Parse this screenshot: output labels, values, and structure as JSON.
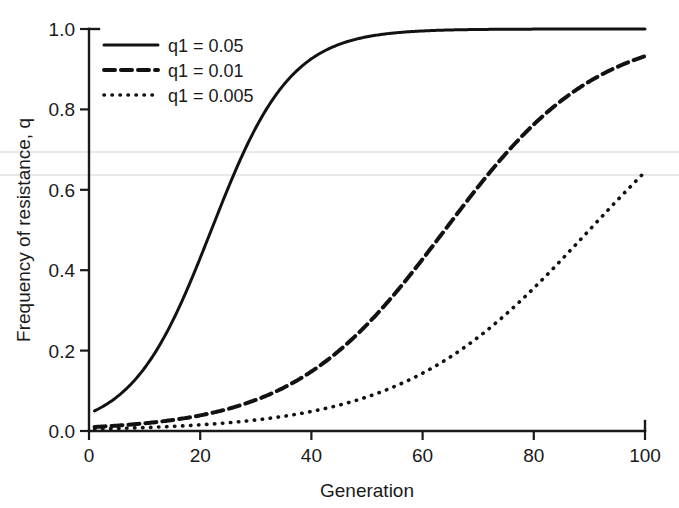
{
  "chart_data": {
    "type": "line",
    "title": "",
    "xlabel": "Generation",
    "ylabel": "Frequency of resistance, q",
    "xlim": [
      0,
      100
    ],
    "ylim": [
      0.0,
      1.0
    ],
    "xticks": [
      0,
      20,
      40,
      60,
      80,
      100
    ],
    "yticks": [
      0.0,
      0.2,
      0.4,
      0.6,
      0.8,
      1.0
    ],
    "xtick_labels": [
      "0",
      "20",
      "40",
      "60",
      "80",
      "100"
    ],
    "ytick_labels": [
      "0.0",
      "0.2",
      "0.4",
      "0.6",
      "0.8",
      "1.0"
    ],
    "grid": false,
    "legend_position": "top-left",
    "series": [
      {
        "name": "q1 = 0.05",
        "style": "solid",
        "color": "#121212",
        "q1": 0.05,
        "growth_rate": 0.3,
        "midpoint_generation": 22,
        "x": [
          1,
          5,
          10,
          14,
          18,
          20,
          22,
          24,
          26,
          28,
          30,
          35,
          40,
          50,
          60,
          70,
          80,
          90,
          100
        ],
        "y": [
          0.05,
          0.083,
          0.155,
          0.243,
          0.372,
          0.443,
          0.517,
          0.59,
          0.659,
          0.722,
          0.777,
          0.877,
          0.935,
          0.985,
          0.997,
          0.999,
          1.0,
          1.0,
          1.0
        ]
      },
      {
        "name": "q1 = 0.01",
        "style": "dashed",
        "color": "#121212",
        "q1": 0.01,
        "growth_rate": 0.3,
        "midpoint_generation": 64,
        "x": [
          1,
          10,
          20,
          30,
          40,
          45,
          50,
          55,
          58,
          60,
          62,
          64,
          66,
          68,
          70,
          75,
          80,
          90,
          100
        ],
        "y": [
          0.01,
          0.015,
          0.025,
          0.042,
          0.069,
          0.088,
          0.112,
          0.141,
          0.161,
          0.175,
          0.19,
          0.5,
          0.7,
          0.85,
          0.94,
          0.988,
          0.996,
          0.999,
          1.0
        ]
      },
      {
        "name": "q1 = 0.005",
        "style": "dotted",
        "color": "#121212",
        "q1": 0.005,
        "growth_rate": 0.3,
        "midpoint_generation": 90,
        "x": [
          1,
          10,
          20,
          30,
          40,
          50,
          60,
          65,
          70,
          75,
          80,
          84,
          88,
          90,
          92,
          94,
          96,
          98,
          100
        ],
        "y": [
          0.005,
          0.008,
          0.012,
          0.019,
          0.031,
          0.05,
          0.08,
          0.102,
          0.13,
          0.18,
          0.25,
          0.33,
          0.45,
          0.52,
          0.62,
          0.72,
          0.83,
          0.93,
          0.995
        ]
      }
    ],
    "annotations": {
      "scan_artifact_lines": [
        0.695,
        0.637
      ]
    }
  },
  "legend": {
    "entries": [
      {
        "label": "q1 = 0.05",
        "style": "solid"
      },
      {
        "label": "q1 = 0.01",
        "style": "dashed"
      },
      {
        "label": "q1 = 0.005",
        "style": "dotted"
      }
    ]
  }
}
